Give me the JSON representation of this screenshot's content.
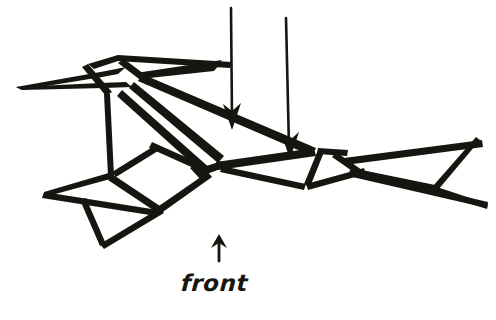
{
  "figure": {
    "kind": "origami-folding-diagram",
    "background_color": "#ffffff",
    "ink_color": "#17150f",
    "width": 496,
    "height": 320,
    "style": "hand-drawn-line-art"
  },
  "labels": {
    "front": {
      "text": "front",
      "style": "italic-handwritten"
    }
  },
  "icons": {
    "front_arrow": "arrow-up-icon",
    "fold_arrow_1": "arrow-down-icon",
    "fold_arrow_2": "arrow-down-icon"
  },
  "annotations": {
    "fold_arrows": [
      {
        "name": "fold-arrow-left",
        "direction": "down",
        "from_x": 231,
        "from_y": 8,
        "to_x": 232,
        "to_y": 127
      },
      {
        "name": "fold-arrow-right",
        "direction": "down",
        "from_x": 285,
        "from_y": 18,
        "to_x": 290,
        "to_y": 157
      }
    ],
    "orientation_arrow": {
      "name": "front-orientation-arrow",
      "direction": "up",
      "from_x": 219,
      "from_y": 259,
      "to_x": 219,
      "to_y": 236
    }
  }
}
